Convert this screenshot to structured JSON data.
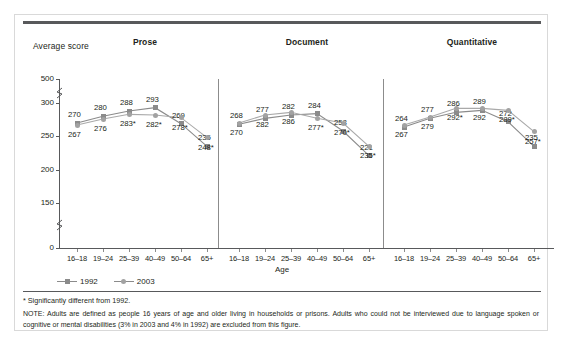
{
  "figure": {
    "y_axis_title": "Average score",
    "x_axis_title": "Age",
    "footnote": "* Significantly different from 1992.",
    "note": "NOTE: Adults are defined as people 16 years of age and older living in households or prisons. Adults who could not be interviewed due to language spoken or cognitive or mental disabilities (3% in 2003 and 4% in 1992) are excluded from this figure."
  },
  "legend": {
    "position": "bottom-left",
    "entries": [
      {
        "label": "1992",
        "marker": "square",
        "color": "#8b8b8b"
      },
      {
        "label": "2003",
        "marker": "circle",
        "color": "#a2a2a2"
      }
    ]
  },
  "chart_data": {
    "type": "line",
    "title": "",
    "xlabel": "Age",
    "ylabel": "Average score",
    "ylim": [
      0,
      500
    ],
    "yticks": [
      0,
      150,
      200,
      250,
      300,
      500
    ],
    "ytick_labels": [
      "0",
      "150",
      "200",
      "250",
      "300",
      "500"
    ],
    "axis_breaks": [
      "between 0 and 150",
      "between 300 and 500"
    ],
    "grid": false,
    "legend_position": "bottom-left",
    "categories": [
      "16–18",
      "19–24",
      "25–39",
      "40–49",
      "50–64",
      "65+"
    ],
    "panels": [
      {
        "name": "Prose",
        "series": [
          {
            "name": "1992",
            "marker": "square",
            "values": [
              270,
              280,
              288,
              293,
              269,
              235
            ],
            "labels": [
              "270",
              "280",
              "288",
              "293",
              "269",
              "235"
            ],
            "significant": [
              false,
              false,
              false,
              false,
              false,
              false
            ]
          },
          {
            "name": "2003",
            "marker": "circle",
            "values": [
              267,
              276,
              283,
              282,
              278,
              248
            ],
            "labels": [
              "267",
              "276",
              "283*",
              "282*",
              "278*",
              "248*"
            ],
            "significant": [
              false,
              false,
              true,
              true,
              true,
              true
            ]
          }
        ]
      },
      {
        "name": "Document",
        "series": [
          {
            "name": "1992",
            "marker": "square",
            "values": [
              268,
              277,
              282,
              284,
              258,
              221
            ],
            "labels": [
              "268",
              "277",
              "282",
              "284",
              "258",
              "221"
            ],
            "significant": [
              false,
              false,
              false,
              false,
              false,
              false
            ]
          },
          {
            "name": "2003",
            "marker": "circle",
            "values": [
              270,
              282,
              286,
              277,
              270,
              235
            ],
            "labels": [
              "270",
              "282",
              "286",
              "277*",
              "270*",
              "235*"
            ],
            "significant": [
              false,
              false,
              false,
              true,
              true,
              true
            ]
          }
        ]
      },
      {
        "name": "Quantitative",
        "series": [
          {
            "name": "1992",
            "marker": "square",
            "values": [
              264,
              277,
              286,
              289,
              272,
              235
            ],
            "labels": [
              "264",
              "277",
              "286",
              "289",
              "272",
              "235"
            ],
            "significant": [
              false,
              false,
              false,
              false,
              false,
              false
            ]
          },
          {
            "name": "2003",
            "marker": "circle",
            "values": [
              267,
              279,
              292,
              292,
              289,
              257
            ],
            "labels": [
              "267",
              "279",
              "292*",
              "292",
              "289*",
              "257*"
            ],
            "significant": [
              false,
              false,
              true,
              false,
              true,
              true
            ]
          }
        ]
      }
    ]
  }
}
